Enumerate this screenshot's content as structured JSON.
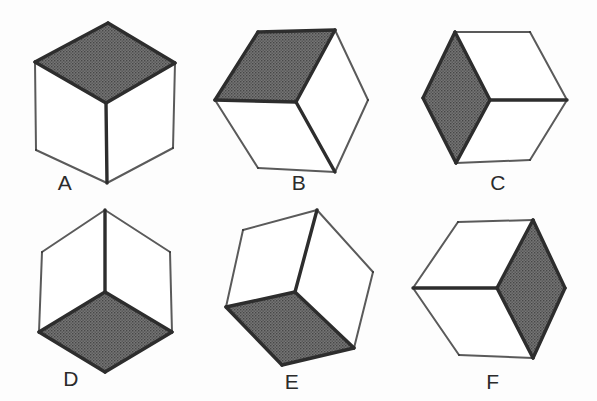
{
  "figure": {
    "background_color": "#fdfdfd",
    "stroke_color": "#2d2d2d",
    "shaded_face_color": "#6e6e6e",
    "plain_face_color": "#ffffff",
    "label_color": "#2b2b2b"
  },
  "cubes": [
    {
      "id": "cube-a",
      "label": "A",
      "label_x": 65,
      "label_y": 190,
      "shaded_face": "top",
      "faces": [
        {
          "name": "top-face",
          "shaded": true,
          "points": "108,23 175,63 106,103 35,62"
        },
        {
          "name": "left-face",
          "shaded": false,
          "points": "35,62 106,103 107,183 36,150"
        },
        {
          "name": "right-face",
          "shaded": false,
          "points": "106,103 175,63 173,148 107,183"
        }
      ],
      "heavy_edges": [
        "35,62 108,23",
        "108,23 175,63",
        "35,62 106,103",
        "175,63 106,103",
        "106,103 107,183"
      ],
      "light_edges": [
        "35,62 36,150",
        "36,150 107,183",
        "107,183 173,148",
        "173,148 175,63"
      ]
    },
    {
      "id": "cube-b",
      "label": "B",
      "label_x": 299,
      "label_y": 190,
      "shaded_face": "upper-left",
      "faces": [
        {
          "name": "upper-left-face",
          "shaded": true,
          "points": "258,32 335,30 296,102 215,100"
        },
        {
          "name": "lower-left-face",
          "shaded": false,
          "points": "215,100 296,102 335,172 258,168"
        },
        {
          "name": "right-face",
          "shaded": false,
          "points": "296,102 335,30 368,100 335,172"
        }
      ],
      "heavy_edges": [
        "258,32 335,30",
        "215,100 258,32",
        "215,100 296,102",
        "296,102 335,30",
        "296,102 335,172"
      ],
      "light_edges": [
        "215,100 258,168",
        "258,168 335,172",
        "335,30 368,100",
        "368,100 335,172"
      ]
    },
    {
      "id": "cube-c",
      "label": "C",
      "label_x": 498,
      "label_y": 190,
      "shaded_face": "left",
      "faces": [
        {
          "name": "left-face",
          "shaded": true,
          "points": "455,32 490,100 456,163 423,98"
        },
        {
          "name": "upper-right-face",
          "shaded": false,
          "points": "455,32 530,32 567,100 490,100"
        },
        {
          "name": "lower-right-face",
          "shaded": false,
          "points": "490,100 567,100 530,160 456,163"
        }
      ],
      "heavy_edges": [
        "455,32 490,100",
        "423,98 455,32",
        "423,98 456,163",
        "456,163 490,100",
        "490,100 567,100"
      ],
      "light_edges": [
        "455,32 530,32",
        "530,32 567,100",
        "456,163 530,160",
        "530,160 567,100"
      ]
    },
    {
      "id": "cube-d",
      "label": "D",
      "label_x": 71,
      "label_y": 386,
      "shaded_face": "bottom",
      "faces": [
        {
          "name": "bottom-face",
          "shaded": true,
          "points": "105,292 172,332 105,372 39,332"
        },
        {
          "name": "upper-left-face",
          "shaded": false,
          "points": "42,252 105,210 105,292 39,332"
        },
        {
          "name": "upper-right-face",
          "shaded": false,
          "points": "105,210 170,252 172,332 105,292"
        }
      ],
      "heavy_edges": [
        "105,210 105,292",
        "39,332 105,292",
        "105,292 172,332",
        "39,332 105,372",
        "105,372 172,332"
      ],
      "light_edges": [
        "42,252 105,210",
        "105,210 170,252",
        "42,252 39,332",
        "170,252 172,332"
      ]
    },
    {
      "id": "cube-e",
      "label": "E",
      "label_x": 292,
      "label_y": 389,
      "shaded_face": "bottom",
      "faces": [
        {
          "name": "bottom-face",
          "shaded": true,
          "points": "295,292 354,348 282,365 226,307"
        },
        {
          "name": "upper-left-face",
          "shaded": false,
          "points": "243,230 317,210 295,292 226,307"
        },
        {
          "name": "right-face",
          "shaded": false,
          "points": "317,210 373,272 354,348 295,292"
        }
      ],
      "heavy_edges": [
        "317,210 295,292",
        "226,307 295,292",
        "295,292 354,348",
        "226,307 282,365",
        "282,365 354,348"
      ],
      "light_edges": [
        "243,230 317,210",
        "243,230 226,307",
        "317,210 373,272",
        "373,272 354,348"
      ]
    },
    {
      "id": "cube-f",
      "label": "F",
      "label_x": 493,
      "label_y": 389,
      "shaded_face": "right",
      "faces": [
        {
          "name": "right-face",
          "shaded": true,
          "points": "533,220 565,288 533,358 497,288"
        },
        {
          "name": "upper-left-face",
          "shaded": false,
          "points": "458,222 533,220 497,288 413,288"
        },
        {
          "name": "lower-left-face",
          "shaded": false,
          "points": "413,288 497,288 533,358 459,355"
        }
      ],
      "heavy_edges": [
        "533,220 497,288",
        "533,220 565,288",
        "565,288 533,358",
        "413,288 497,288",
        "497,288 533,358"
      ],
      "light_edges": [
        "458,222 533,220",
        "413,288 458,222",
        "413,288 459,355",
        "459,355 533,358"
      ]
    }
  ]
}
